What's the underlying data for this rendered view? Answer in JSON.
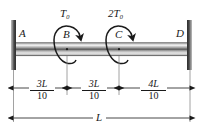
{
  "figure": {
    "type": "engineering-free-body-diagram",
    "background_color": "#ffffff",
    "line_color": "#1a1a1a"
  },
  "supports": {
    "left": {
      "name": "wall-support-left",
      "color": "#4d4d4d"
    },
    "right": {
      "name": "wall-support-right",
      "color": "#4d4d4d"
    }
  },
  "shaft": {
    "name": "shaft",
    "highlight_color": "#e8e8e8",
    "mid_color": "#a8a8a8",
    "dark_color": "#5a5a5a"
  },
  "nodes": [
    {
      "id": "A",
      "label": "A"
    },
    {
      "id": "B",
      "label": "B"
    },
    {
      "id": "C",
      "label": "C"
    },
    {
      "id": "D",
      "label": "D"
    }
  ],
  "torques": [
    {
      "id": "T0",
      "at": "B",
      "magnitude": "T",
      "subscript": "0",
      "label": "T₀"
    },
    {
      "id": "2T0",
      "at": "C",
      "magnitude": "2T",
      "subscript": "0",
      "label": "2T₀"
    }
  ],
  "dimensions": [
    {
      "id": "AB",
      "numerator": "3L",
      "denominator": "10",
      "label": "3L/10"
    },
    {
      "id": "BC",
      "numerator": "3L",
      "denominator": "10",
      "label": "3L/10"
    },
    {
      "id": "CD",
      "numerator": "4L",
      "denominator": "10",
      "label": "4L/10"
    }
  ],
  "total_dimension": {
    "id": "AD",
    "label": "L"
  }
}
